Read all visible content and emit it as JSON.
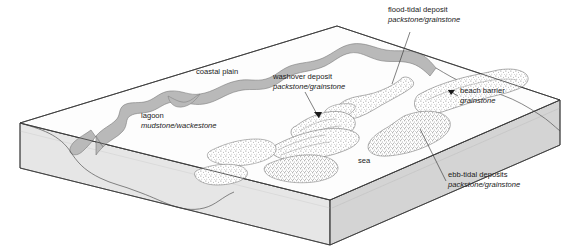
{
  "figure": {
    "type": "block-diagram",
    "background_color": "#ffffff",
    "ink_color": "#1a1a1a"
  },
  "palette": {
    "top_surface": "#fdfdfd",
    "lagoon_fill": "#b9b9b9",
    "left_face": "#e4e4e4",
    "front_face": "#dedede",
    "right_face": "#d2d2d2",
    "sand_stipple": "#6e6e6e",
    "outline": "#3a3a3a"
  },
  "labels": [
    {
      "id": "coastal-plain",
      "line1": "coastal plain",
      "line2": "",
      "x": 196,
      "y": 74,
      "anchor": "start",
      "leader": false
    },
    {
      "id": "lagoon",
      "line1": "lagoon",
      "line2": "mudstone/wackestone",
      "x": 141,
      "y": 118,
      "anchor": "start",
      "leader": false
    },
    {
      "id": "washover-deposit",
      "line1": "washover deposit",
      "line2": "packstone/grainstone",
      "x": 273,
      "y": 79,
      "anchor": "start",
      "leader": true
    },
    {
      "id": "flood-tidal-deposit",
      "line1": "flood-tidal deposit",
      "line2": "packstone/grainstone",
      "x": 388,
      "y": 12,
      "anchor": "start",
      "leader": true
    },
    {
      "id": "beach-barrier",
      "line1": "beach barrier",
      "line2": "grainstone",
      "x": 460,
      "y": 93,
      "anchor": "start",
      "leader": true
    },
    {
      "id": "ebb-tidal-deposits",
      "line1": "ebb-tidal deposits",
      "line2": "packstone/grainstone",
      "x": 448,
      "y": 177,
      "anchor": "start",
      "leader": true
    },
    {
      "id": "sea",
      "line1": "sea",
      "line2": "",
      "x": 358,
      "y": 163,
      "anchor": "start",
      "leader": false
    }
  ],
  "geometry": {
    "top_face_corners": "left (20,123) · top (337,26) · right (560,100) · front (330,200)",
    "slab_thickness_px": 45
  }
}
